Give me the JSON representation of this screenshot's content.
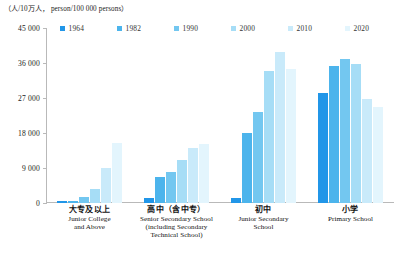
{
  "unit_caption": "（人/10万人， person/100 000 persons）",
  "legend": {
    "items": [
      {
        "label": "1964",
        "color": "#2196e8"
      },
      {
        "label": "1982",
        "color": "#4cb4ec"
      },
      {
        "label": "1990",
        "color": "#73c7f0"
      },
      {
        "label": "2000",
        "color": "#a6ddf6"
      },
      {
        "label": "2010",
        "color": "#c9eafa"
      },
      {
        "label": "2020",
        "color": "#e3f5fd"
      }
    ]
  },
  "axis": {
    "y_ticks": [
      "0",
      "9 000",
      "18 000",
      "27 000",
      "36 000",
      "45 000"
    ]
  },
  "categories": [
    {
      "cn": "大专及以上",
      "en": "Junior College\nand Above"
    },
    {
      "cn": "高中（含中专）",
      "en": "Senior Secondary School\n(including Secondary\nTechnical School)"
    },
    {
      "cn": "初中",
      "en": "Junior Secondary\nSchool"
    },
    {
      "cn": "小学",
      "en": "Primary School"
    }
  ],
  "chart_data": {
    "type": "bar",
    "title": "",
    "subtitle": "",
    "xlabel": "",
    "ylabel": "（人/10万人， person/100 000 persons）",
    "ylim": [
      0,
      45000
    ],
    "y_ticks": [
      0,
      9000,
      18000,
      27000,
      36000,
      45000
    ],
    "grid": false,
    "legend_position": "top",
    "categories": [
      "大专及以上 Junior College and Above",
      "高中（含中专）Senior Secondary School (including Secondary Technical School)",
      "初中 Junior Secondary School",
      "小学 Primary School"
    ],
    "series": [
      {
        "name": "1964",
        "color": "#2196e8",
        "values": [
          416,
          1319,
          1418,
          28330
        ]
      },
      {
        "name": "1982",
        "color": "#4cb4ec",
        "values": [
          615,
          6779,
          17892,
          35237
        ]
      },
      {
        "name": "1990",
        "color": "#73c7f0",
        "values": [
          1422,
          8039,
          23344,
          37057
        ]
      },
      {
        "name": "2000",
        "color": "#a6ddf6",
        "values": [
          3611,
          11146,
          33961,
          35701
        ]
      },
      {
        "name": "2010",
        "color": "#c9eafa",
        "values": [
          8930,
          14032,
          38788,
          26779
        ]
      },
      {
        "name": "2020",
        "color": "#e3f5fd",
        "values": [
          15467,
          15088,
          34507,
          24767
        ]
      }
    ]
  }
}
